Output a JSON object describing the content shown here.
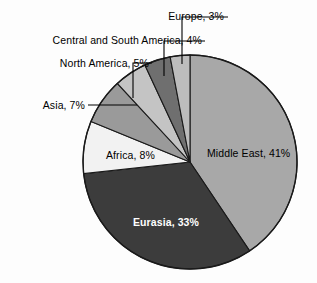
{
  "chart_data": {
    "type": "pie",
    "title": "",
    "subtitle": "",
    "xlabel": "",
    "ylabel": "",
    "legend_position": "none",
    "grid": false,
    "start_angle_deg": 0,
    "direction": "clockwise",
    "categories": [
      "Middle East",
      "Eurasia",
      "Africa",
      "Asia",
      "North America",
      "Central and South America",
      "Europe"
    ],
    "values": [
      41,
      33,
      8,
      7,
      5,
      4,
      3
    ],
    "unit": "%",
    "slices": [
      {
        "name": "Middle East",
        "value": 41,
        "label": "Middle East, 41%",
        "color": "#a8a8a8",
        "label_placement": "inside",
        "label_color": "#000000"
      },
      {
        "name": "Eurasia",
        "value": 33,
        "label": "Eurasia, 33%",
        "color": "#3c3c3c",
        "label_placement": "inside",
        "label_color": "#ffffff"
      },
      {
        "name": "Africa",
        "value": 8,
        "label": "Africa, 8%",
        "color": "#f2f2f2",
        "label_placement": "inside",
        "label_color": "#000000"
      },
      {
        "name": "Asia",
        "value": 7,
        "label": "Asia, 7%",
        "color": "#9a9a9a",
        "label_placement": "callout",
        "label_color": "#000000"
      },
      {
        "name": "North America",
        "value": 5,
        "label": "North America, 5%",
        "color": "#c4c4c4",
        "label_placement": "callout",
        "label_color": "#000000"
      },
      {
        "name": "Central and South America",
        "value": 4,
        "label": "Central and South America, 4%",
        "color": "#6f6f6f",
        "label_placement": "callout",
        "label_color": "#000000"
      },
      {
        "name": "Europe",
        "value": 3,
        "label": "Europe, 3%",
        "color": "#bdbdbd",
        "label_placement": "callout",
        "label_color": "#000000"
      }
    ],
    "colors": {
      "background": "#fdfdfd",
      "outline": "#1a1a1a",
      "leader_line": "#000000",
      "text": "#000000",
      "text_on_dark": "#ffffff"
    }
  }
}
